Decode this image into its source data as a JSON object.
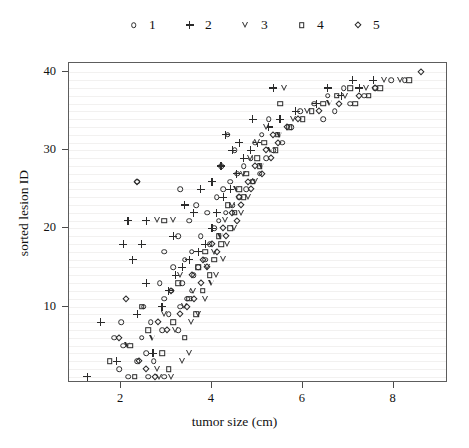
{
  "chart_data": {
    "type": "scatter",
    "title": "",
    "xlabel": "tumor size (cm)",
    "ylabel": "sorted lesion ID",
    "xlim": [
      0.85,
      9.2
    ],
    "ylim": [
      0.2,
      41.2
    ],
    "xticks": [
      2,
      4,
      6,
      8
    ],
    "yticks": [
      10,
      20,
      30,
      40
    ],
    "grid": "horizontal",
    "grid_color": "#f2f1f0",
    "legend_position": "top-center",
    "marker_color": "#2b2b2b",
    "series": [
      {
        "name": "1",
        "marker": "circle",
        "points": [
          [
            2.15,
            1
          ],
          [
            2.6,
            1
          ],
          [
            2.95,
            1
          ],
          [
            1.95,
            2
          ],
          [
            2.35,
            3
          ],
          [
            2.72,
            3
          ],
          [
            2.55,
            4
          ],
          [
            2.05,
            5
          ],
          [
            1.85,
            6
          ],
          [
            2.45,
            6
          ],
          [
            2.9,
            7
          ],
          [
            3.25,
            7
          ],
          [
            2.0,
            8
          ],
          [
            2.65,
            8
          ],
          [
            3.05,
            9
          ],
          [
            2.5,
            10
          ],
          [
            3.3,
            10
          ],
          [
            2.95,
            11
          ],
          [
            3.45,
            11
          ],
          [
            3.1,
            12
          ],
          [
            3.55,
            12
          ],
          [
            2.85,
            13
          ],
          [
            3.35,
            13
          ],
          [
            3.6,
            14
          ],
          [
            3.15,
            15
          ],
          [
            3.7,
            15
          ],
          [
            3.4,
            16
          ],
          [
            3.85,
            16
          ],
          [
            2.95,
            17
          ],
          [
            3.55,
            17
          ],
          [
            3.95,
            18
          ],
          [
            3.25,
            19
          ],
          [
            3.75,
            19
          ],
          [
            4.05,
            20
          ],
          [
            3.5,
            21
          ],
          [
            4.15,
            21
          ],
          [
            3.9,
            22
          ],
          [
            4.3,
            22
          ],
          [
            3.65,
            23
          ],
          [
            4.45,
            23
          ],
          [
            4.1,
            24
          ],
          [
            4.6,
            24
          ],
          [
            3.3,
            25
          ],
          [
            4.25,
            25
          ],
          [
            4.75,
            25
          ],
          [
            2.35,
            26
          ],
          [
            4.4,
            26
          ],
          [
            4.9,
            26
          ],
          [
            4.55,
            27
          ],
          [
            5.05,
            27
          ],
          [
            4.2,
            28
          ],
          [
            4.7,
            28
          ],
          [
            4.85,
            29
          ],
          [
            5.2,
            29
          ],
          [
            4.5,
            30
          ],
          [
            5.35,
            30
          ],
          [
            4.95,
            31
          ],
          [
            5.55,
            31
          ],
          [
            4.35,
            32
          ],
          [
            5.1,
            32
          ],
          [
            5.75,
            33
          ],
          [
            5.25,
            34
          ],
          [
            6.45,
            34
          ],
          [
            5.95,
            35
          ],
          [
            6.7,
            35
          ],
          [
            6.25,
            36
          ],
          [
            7.05,
            36
          ],
          [
            6.55,
            37
          ],
          [
            7.35,
            37
          ],
          [
            6.9,
            38
          ],
          [
            7.6,
            38
          ],
          [
            7.95,
            39
          ],
          [
            8.25,
            39
          ]
        ]
      },
      {
        "name": "2",
        "marker": "plus",
        "points": [
          [
            1.25,
            1
          ],
          [
            1.9,
            3
          ],
          [
            2.7,
            4
          ],
          [
            1.55,
            8
          ],
          [
            2.35,
            9
          ],
          [
            2.9,
            10
          ],
          [
            3.05,
            12
          ],
          [
            2.55,
            13
          ],
          [
            3.2,
            14
          ],
          [
            3.35,
            15
          ],
          [
            2.25,
            16
          ],
          [
            3.5,
            16
          ],
          [
            3.7,
            17
          ],
          [
            2.05,
            18
          ],
          [
            2.45,
            18
          ],
          [
            3.85,
            18
          ],
          [
            3.15,
            19
          ],
          [
            4.0,
            20
          ],
          [
            2.15,
            21
          ],
          [
            2.55,
            21
          ],
          [
            3.6,
            22
          ],
          [
            4.1,
            22
          ],
          [
            3.4,
            23
          ],
          [
            4.25,
            24
          ],
          [
            3.75,
            25
          ],
          [
            4.4,
            25
          ],
          [
            4.0,
            26
          ],
          [
            4.55,
            27
          ],
          [
            4.2,
            28
          ],
          [
            4.7,
            29
          ],
          [
            4.45,
            30
          ],
          [
            4.85,
            30
          ],
          [
            4.6,
            31
          ],
          [
            5.0,
            31
          ],
          [
            4.3,
            32
          ],
          [
            5.25,
            33
          ],
          [
            4.9,
            34
          ],
          [
            5.5,
            34
          ],
          [
            5.85,
            35
          ],
          [
            6.3,
            36
          ],
          [
            6.85,
            37
          ],
          [
            5.35,
            38
          ],
          [
            6.55,
            38
          ],
          [
            7.25,
            38
          ],
          [
            7.1,
            39
          ],
          [
            7.55,
            39
          ]
        ]
      },
      {
        "name": "3",
        "marker": "triangle-down",
        "points": [
          [
            2.85,
            1
          ],
          [
            3.1,
            1
          ],
          [
            2.8,
            2
          ],
          [
            3.35,
            3
          ],
          [
            3.5,
            4
          ],
          [
            2.15,
            5
          ],
          [
            2.7,
            6
          ],
          [
            3.2,
            7
          ],
          [
            3.55,
            8
          ],
          [
            2.95,
            9
          ],
          [
            3.7,
            9
          ],
          [
            3.4,
            10
          ],
          [
            3.85,
            11
          ],
          [
            3.6,
            12
          ],
          [
            4.0,
            13
          ],
          [
            3.3,
            14
          ],
          [
            4.1,
            14
          ],
          [
            3.9,
            15
          ],
          [
            4.25,
            16
          ],
          [
            4.05,
            17
          ],
          [
            4.35,
            18
          ],
          [
            4.2,
            19
          ],
          [
            4.5,
            20
          ],
          [
            2.8,
            21
          ],
          [
            3.15,
            21
          ],
          [
            4.3,
            21
          ],
          [
            4.65,
            22
          ],
          [
            4.45,
            23
          ],
          [
            4.8,
            24
          ],
          [
            4.55,
            25
          ],
          [
            4.95,
            26
          ],
          [
            4.7,
            27
          ],
          [
            5.1,
            28
          ],
          [
            4.85,
            29
          ],
          [
            5.3,
            30
          ],
          [
            5.0,
            31
          ],
          [
            5.5,
            32
          ],
          [
            5.2,
            33
          ],
          [
            5.8,
            34
          ],
          [
            6.1,
            35
          ],
          [
            6.6,
            36
          ],
          [
            6.95,
            37
          ],
          [
            5.6,
            38
          ],
          [
            7.4,
            38
          ],
          [
            7.8,
            39
          ],
          [
            8.15,
            39
          ]
        ]
      },
      {
        "name": "4",
        "marker": "square",
        "points": [
          [
            2.3,
            1
          ],
          [
            3.05,
            2
          ],
          [
            1.75,
            3
          ],
          [
            2.9,
            4
          ],
          [
            2.2,
            5
          ],
          [
            3.4,
            6
          ],
          [
            2.6,
            7
          ],
          [
            3.15,
            8
          ],
          [
            3.65,
            9
          ],
          [
            2.45,
            10
          ],
          [
            3.5,
            11
          ],
          [
            3.8,
            12
          ],
          [
            3.25,
            13
          ],
          [
            3.95,
            14
          ],
          [
            3.7,
            15
          ],
          [
            4.05,
            16
          ],
          [
            3.85,
            17
          ],
          [
            4.2,
            18
          ],
          [
            4.15,
            19
          ],
          [
            4.4,
            20
          ],
          [
            2.95,
            21
          ],
          [
            4.5,
            22
          ],
          [
            4.35,
            23
          ],
          [
            4.7,
            24
          ],
          [
            4.6,
            25
          ],
          [
            4.9,
            26
          ],
          [
            4.75,
            27
          ],
          [
            5.05,
            28
          ],
          [
            5.0,
            29
          ],
          [
            5.4,
            30
          ],
          [
            5.15,
            31
          ],
          [
            5.45,
            32
          ],
          [
            5.7,
            33
          ],
          [
            6.0,
            34
          ],
          [
            6.2,
            35
          ],
          [
            5.5,
            36
          ],
          [
            6.45,
            36
          ],
          [
            7.15,
            36
          ],
          [
            6.75,
            37
          ],
          [
            7.45,
            37
          ],
          [
            7.05,
            38
          ],
          [
            7.7,
            38
          ],
          [
            8.35,
            39
          ]
        ]
      },
      {
        "name": "5",
        "marker": "diamond",
        "points": [
          [
            2.75,
            1
          ],
          [
            2.55,
            2
          ],
          [
            2.4,
            3
          ],
          [
            1.95,
            6
          ],
          [
            3.0,
            7
          ],
          [
            2.8,
            8
          ],
          [
            3.3,
            9
          ],
          [
            3.45,
            10
          ],
          [
            2.1,
            11
          ],
          [
            3.6,
            11
          ],
          [
            3.1,
            12
          ],
          [
            3.75,
            13
          ],
          [
            3.55,
            14
          ],
          [
            3.9,
            15
          ],
          [
            3.8,
            16
          ],
          [
            4.1,
            17
          ],
          [
            4.0,
            18
          ],
          [
            4.3,
            19
          ],
          [
            4.25,
            20
          ],
          [
            4.55,
            21
          ],
          [
            4.45,
            22
          ],
          [
            4.65,
            23
          ],
          [
            4.6,
            24
          ],
          [
            4.85,
            25
          ],
          [
            2.35,
            26
          ],
          [
            4.8,
            26
          ],
          [
            5.1,
            27
          ],
          [
            4.95,
            28
          ],
          [
            5.3,
            29
          ],
          [
            5.2,
            30
          ],
          [
            5.45,
            31
          ],
          [
            5.35,
            32
          ],
          [
            5.65,
            33
          ],
          [
            5.9,
            34
          ],
          [
            6.35,
            35
          ],
          [
            6.8,
            36
          ],
          [
            7.25,
            37
          ],
          [
            7.6,
            38
          ],
          [
            8.6,
            40
          ]
        ]
      }
    ],
    "legend": [
      {
        "label": "1",
        "marker": "circle"
      },
      {
        "label": "2",
        "marker": "plus"
      },
      {
        "label": "3",
        "marker": "triangle-down"
      },
      {
        "label": "4",
        "marker": "square"
      },
      {
        "label": "5",
        "marker": "diamond"
      }
    ]
  }
}
